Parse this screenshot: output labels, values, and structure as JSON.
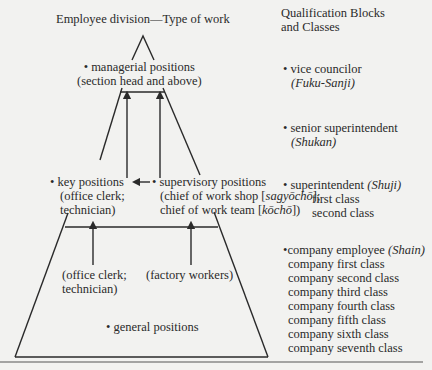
{
  "left_header": "Employee division—Type of work",
  "right_header": [
    "Qualification Blocks",
    "and Classes"
  ],
  "pyramid": {
    "managerial": [
      "• managerial positions",
      "(section head and above)"
    ],
    "key": [
      "• key positions",
      "(office clerk;",
      "technician)"
    ],
    "supervisory": {
      "line1": "• supervisory positions",
      "line2_pre": "(chief of work shop [",
      "line2_it": "sagyōchō",
      "line2_post": "];",
      "line3_pre": "chief of work team [",
      "line3_it": "kōchō",
      "line3_post": "])"
    },
    "lower_left": [
      "(office clerk;",
      "technician)"
    ],
    "lower_right": "(factory workers)",
    "general": "• general positions"
  },
  "qualifications": {
    "vice_councilor": {
      "label": "• vice councilor",
      "jp": "(Fuku-Sanji)"
    },
    "senior_superintendent": {
      "label": "• senior superintendent",
      "jp": "(Shukan)"
    },
    "superintendent": {
      "label": "• superintendent ",
      "jp": "(Shuji)",
      "classes": [
        "first class",
        "second class"
      ]
    },
    "company_employee": {
      "label": "•company employee ",
      "jp": "(Shain)",
      "classes": [
        "company first class",
        "company second class",
        "company third class",
        "company fourth class",
        "company fifth class",
        "company sixth class",
        "company seventh class"
      ]
    }
  }
}
